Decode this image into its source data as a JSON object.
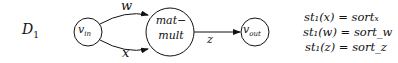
{
  "diagram": {
    "label": "D",
    "label_sub": "1",
    "nodes": [
      {
        "id": "v_in",
        "base": "v",
        "sub": "in"
      },
      {
        "id": "mat_mult",
        "line1": "mat−",
        "line2": "mult"
      },
      {
        "id": "v_out",
        "base": "v",
        "sub": "out"
      }
    ],
    "edges": [
      {
        "from": "v_in",
        "to": "mat_mult",
        "label": "w"
      },
      {
        "from": "v_in",
        "to": "mat_mult",
        "label": "x"
      },
      {
        "from": "mat_mult",
        "to": "v_out",
        "label": "z"
      }
    ],
    "equations": [
      {
        "lhs": "st₁(x)",
        "rhs": "sortₓ"
      },
      {
        "lhs": "st₁(w)",
        "rhs": "sort_w"
      },
      {
        "lhs": "st₁(z)",
        "rhs": "sort_z"
      }
    ]
  }
}
